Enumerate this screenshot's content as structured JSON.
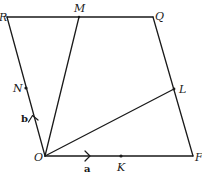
{
  "diagram": {
    "type": "geometry-figure",
    "points": {
      "R": {
        "label": "R",
        "x": 7,
        "y": 17
      },
      "M": {
        "label": "M",
        "x": 79,
        "y": 17
      },
      "Q": {
        "label": "Q",
        "x": 153,
        "y": 17
      },
      "L": {
        "label": "L",
        "x": 174,
        "y": 89
      },
      "F": {
        "label": "F",
        "x": 193,
        "y": 156
      },
      "O": {
        "label": "O",
        "x": 45,
        "y": 156
      },
      "N": {
        "label": "N",
        "x": 26,
        "y": 88
      },
      "K": {
        "label": "K",
        "x": 121,
        "y": 156
      }
    },
    "edges": [
      [
        "R",
        "Q"
      ],
      [
        "Q",
        "F"
      ],
      [
        "F",
        "O"
      ],
      [
        "O",
        "R"
      ],
      [
        "O",
        "M"
      ],
      [
        "O",
        "L"
      ]
    ],
    "vectors": {
      "a": {
        "label": "a",
        "along": "OF"
      },
      "b": {
        "label": "b",
        "along": "OR"
      }
    },
    "colors": {
      "ink": "#1a1a1a",
      "background": "#ffffff"
    }
  }
}
